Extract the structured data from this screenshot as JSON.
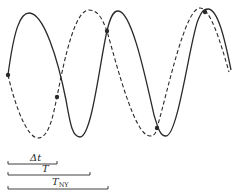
{
  "diagram": {
    "colors": {
      "line": "#2a2a2a",
      "background": "#ffffff"
    },
    "curves": [
      {
        "name": "true-signal",
        "style": "solid",
        "path": "M8,75 C14,30 20,13 29,13 C44,13 58,60 66,100 C70,122 72,137 80,137 C92,137 100,60 107,31 C110,18 113,11 118,11 C132,11 146,80 154,115 C158,128 160,136 166,136 C178,136 190,40 198,20 C201,13 203,9 208,9 C218,9 225,40 231,70"
      },
      {
        "name": "alias-signal",
        "style": "dashed",
        "path": "M8,75 C16,110 28,138 38,138 C50,138 54,110 57,97 C66,50 76,10 89,10 C100,10 104,24 107,31 C118,70 135,136 150,136 C155,136 156,132 157,128 C168,90 185,8 200,8 C210,8 220,40 229,72"
      }
    ],
    "sample_points": [
      {
        "x": 8,
        "y": 75
      },
      {
        "x": 57,
        "y": 97
      },
      {
        "x": 107,
        "y": 31
      },
      {
        "x": 157,
        "y": 128
      },
      {
        "x": 205,
        "y": 12
      }
    ],
    "intervals": [
      {
        "label": "Δt",
        "sub": "",
        "x1": 8,
        "x2": 57,
        "y": 164,
        "label_x": 30,
        "label_y": 161
      },
      {
        "label": "T",
        "sub": "",
        "x1": 8,
        "x2": 90,
        "y": 175,
        "label_x": 42,
        "label_y": 172
      },
      {
        "label": "T",
        "sub": "NY",
        "x1": 8,
        "x2": 108,
        "y": 189,
        "label_x": 52,
        "label_y": 185
      }
    ]
  }
}
